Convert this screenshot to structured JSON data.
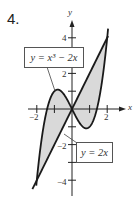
{
  "problem": {
    "number": "4."
  },
  "chart_data": {
    "type": "line",
    "title": "",
    "xlabel": "x",
    "ylabel": "y",
    "xlim": [
      -2.2,
      3.0
    ],
    "ylim": [
      -4.6,
      5.0
    ],
    "x_ticks": [
      -2,
      -1,
      1,
      2
    ],
    "x_tick_labels": [
      "-2",
      "2"
    ],
    "y_ticks": [
      -4,
      -3,
      -2,
      -1,
      1,
      2,
      3,
      4
    ],
    "y_tick_labels": [
      "4",
      "2",
      "-2",
      "-4"
    ],
    "grid": false,
    "series": [
      {
        "name": "y = x^3 - 2x",
        "label": "y = x³ − 2x",
        "function": "x^3 - 2x",
        "x": [
          -2.0,
          -1.5,
          -1.0,
          -0.816,
          -0.5,
          0,
          0.5,
          0.816,
          1.0,
          1.5,
          2.0,
          2.05
        ],
        "y": [
          -4.0,
          -0.375,
          1.0,
          1.089,
          0.875,
          0,
          -0.875,
          -1.089,
          -1.0,
          0.375,
          4.0,
          4.52
        ]
      },
      {
        "name": "y = 2x",
        "label": "y = 2x",
        "function": "2x",
        "x": [
          -2.25,
          -2.0,
          0,
          2.0,
          2.05
        ],
        "y": [
          -4.5,
          -4.0,
          0,
          4.0,
          4.1
        ]
      }
    ],
    "shaded_regions": [
      {
        "between": [
          "y = x^3 - 2x",
          "y = 2x"
        ],
        "x_range": [
          -2,
          0
        ],
        "color": "#d9d9d9"
      },
      {
        "between": [
          "y = 2x",
          "y = x^3 - 2x"
        ],
        "x_range": [
          0,
          2
        ],
        "color": "#d9d9d9"
      }
    ],
    "intersections": [
      [
        -2,
        -4
      ],
      [
        0,
        0
      ],
      [
        2,
        4
      ]
    ],
    "annotations": [
      {
        "text": "y = x³ − 2x",
        "boxed": true,
        "points_to": "cubic curve near x=-1"
      },
      {
        "text": "y = 2x",
        "boxed": true,
        "points_to": "line near x=-0.4"
      }
    ]
  },
  "labels": {
    "x_axis": "x",
    "y_axis": "y",
    "x_neg2": "−2",
    "x_pos2": "2",
    "y_pos4": "4",
    "y_pos2": "2",
    "y_neg2": "−2",
    "y_neg4": "−4",
    "cubic_eq": "y = x³ − 2x",
    "line_eq": "y = 2x"
  },
  "colors": {
    "shade": "#d9d9d9",
    "curve": "#1a1a1a",
    "axis": "#222222"
  }
}
